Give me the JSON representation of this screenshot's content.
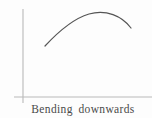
{
  "figure": {
    "caption": "Bending downwards",
    "background_color": "#fdfdfd",
    "width": 152,
    "height": 118
  },
  "axes": {
    "axis_color": "#b9b9b9",
    "axis_line_width": 1.1,
    "origin": {
      "x": 23,
      "y": 97
    },
    "y_axis": {
      "name": "y-axis",
      "x": 23,
      "y_top": 9,
      "y_bottom": 103
    },
    "x_axis": {
      "name": "x-axis",
      "y": 97,
      "x_left": 14,
      "x_right": 152
    },
    "tick_labels": [],
    "grid": false
  },
  "chart_data": {
    "type": "line",
    "title": "Bending downwards",
    "subtitle": "",
    "xlabel": "",
    "ylabel": "",
    "annotations": [
      "Bending downwards"
    ],
    "legend": [],
    "legend_position": "none",
    "grid": false,
    "concavity": "concave down",
    "curve_color": "#555555",
    "curve_width": 1.2,
    "xlim": [
      23,
      152
    ],
    "ylim": [
      97,
      9
    ],
    "x": [
      45,
      52,
      60,
      68,
      76,
      84,
      92,
      100,
      108,
      116,
      124,
      131
    ],
    "y": [
      46,
      38,
      31,
      25,
      20,
      17,
      14,
      13,
      14,
      17,
      21,
      28
    ],
    "path": "M 45 46 C 58 32, 72 19, 89 14 C 106 9, 122 16, 131 28",
    "endpoints": {
      "left": {
        "x": 45,
        "y": 46
      },
      "right": {
        "x": 131,
        "y": 28
      }
    },
    "apex": {
      "x": 100,
      "y": 13
    }
  }
}
